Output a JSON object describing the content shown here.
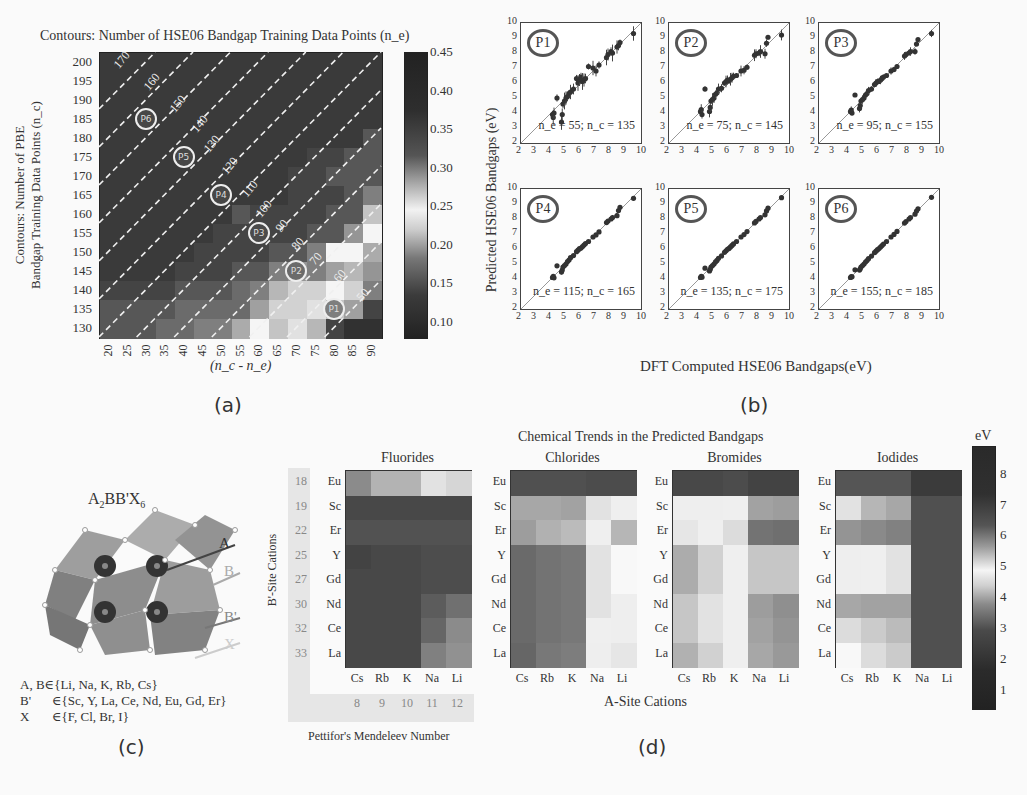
{
  "panels": {
    "a": {
      "label": "(a)"
    },
    "b": {
      "label": "(b)"
    },
    "c": {
      "label": "(c)"
    },
    "d": {
      "label": "(d)"
    }
  },
  "chart_data": [
    {
      "id": "a",
      "type": "heatmap",
      "title": "Contours: Number of HSE06 Bandgap Training Data Points (n_e)",
      "xlabel": "(n_c - n_e)",
      "ylabel": "Contours: Number of PBE Bandgap Training Data Points (n_c)",
      "ylabel_lines": [
        "Contours: Number of PBE",
        "Bandgap Training Data Points (n_c)"
      ],
      "x": [
        20,
        25,
        30,
        35,
        40,
        45,
        50,
        55,
        60,
        65,
        70,
        75,
        80,
        85,
        90
      ],
      "y": [
        200,
        195,
        190,
        185,
        180,
        175,
        170,
        165,
        160,
        155,
        150,
        145,
        140,
        135,
        130
      ],
      "colorbar": {
        "ticks": [
          "0.45",
          "0.40",
          "0.35",
          "0.30",
          "0.25",
          "0.20",
          "0.15",
          "0.10"
        ],
        "range": [
          0.08,
          0.45
        ]
      },
      "contours": [
        "170",
        "160",
        "150",
        "140",
        "130",
        "120",
        "110",
        "100",
        "90",
        "80",
        "70",
        "60",
        "50"
      ],
      "markers": [
        {
          "name": "P1",
          "x": 80,
          "y": 135
        },
        {
          "name": "P2",
          "x": 70,
          "y": 145
        },
        {
          "name": "P3",
          "x": 60,
          "y": 155
        },
        {
          "name": "P4",
          "x": 50,
          "y": 165
        },
        {
          "name": "P5",
          "x": 40,
          "y": 175
        },
        {
          "name": "P6",
          "x": 30,
          "y": 185
        }
      ],
      "values": [
        [
          0.43,
          0.43,
          0.43,
          0.43,
          0.43,
          0.43,
          0.43,
          0.43,
          0.43,
          0.43,
          0.43,
          0.43,
          0.43,
          0.43,
          0.43
        ],
        [
          0.43,
          0.43,
          0.43,
          0.43,
          0.43,
          0.43,
          0.43,
          0.43,
          0.43,
          0.43,
          0.43,
          0.43,
          0.43,
          0.43,
          0.43
        ],
        [
          0.43,
          0.43,
          0.43,
          0.43,
          0.43,
          0.43,
          0.43,
          0.43,
          0.43,
          0.43,
          0.43,
          0.43,
          0.43,
          0.43,
          0.43
        ],
        [
          0.43,
          0.43,
          0.43,
          0.43,
          0.43,
          0.43,
          0.43,
          0.43,
          0.43,
          0.43,
          0.43,
          0.43,
          0.43,
          0.43,
          0.43
        ],
        [
          0.43,
          0.43,
          0.43,
          0.43,
          0.43,
          0.43,
          0.43,
          0.43,
          0.43,
          0.43,
          0.43,
          0.43,
          0.43,
          0.43,
          0.4
        ],
        [
          0.43,
          0.43,
          0.43,
          0.43,
          0.43,
          0.43,
          0.43,
          0.43,
          0.43,
          0.43,
          0.43,
          0.42,
          0.42,
          0.4,
          0.4
        ],
        [
          0.43,
          0.43,
          0.43,
          0.43,
          0.43,
          0.43,
          0.43,
          0.43,
          0.43,
          0.43,
          0.42,
          0.42,
          0.4,
          0.4,
          0.4
        ],
        [
          0.43,
          0.43,
          0.43,
          0.43,
          0.43,
          0.43,
          0.43,
          0.43,
          0.43,
          0.43,
          0.42,
          0.42,
          0.42,
          0.4,
          0.36
        ],
        [
          0.43,
          0.43,
          0.43,
          0.43,
          0.43,
          0.43,
          0.43,
          0.4,
          0.42,
          0.42,
          0.42,
          0.42,
          0.4,
          0.4,
          0.3
        ],
        [
          0.43,
          0.43,
          0.43,
          0.43,
          0.43,
          0.43,
          0.42,
          0.42,
          0.42,
          0.42,
          0.42,
          0.4,
          0.4,
          0.34,
          0.27
        ],
        [
          0.43,
          0.43,
          0.43,
          0.43,
          0.43,
          0.42,
          0.42,
          0.42,
          0.42,
          0.4,
          0.4,
          0.36,
          0.27,
          0.27,
          0.32
        ],
        [
          0.43,
          0.43,
          0.43,
          0.43,
          0.42,
          0.42,
          0.42,
          0.4,
          0.4,
          0.36,
          0.34,
          0.36,
          0.33,
          0.31,
          0.34
        ],
        [
          0.42,
          0.42,
          0.42,
          0.42,
          0.4,
          0.4,
          0.4,
          0.38,
          0.36,
          0.31,
          0.29,
          0.29,
          0.27,
          0.29,
          0.36
        ],
        [
          0.4,
          0.4,
          0.4,
          0.4,
          0.38,
          0.38,
          0.38,
          0.38,
          0.33,
          0.29,
          0.29,
          0.28,
          0.3,
          0.33,
          0.12
        ],
        [
          0.4,
          0.4,
          0.4,
          0.38,
          0.38,
          0.36,
          0.36,
          0.32,
          0.27,
          0.3,
          0.26,
          0.31,
          0.12,
          0.1,
          0.1
        ]
      ]
    },
    {
      "id": "b",
      "type": "scatter",
      "xlabel": "DFT Computed HSE06 Bandgaps(eV)",
      "ylabel": "Predicted HSE06 Bandgaps (eV)",
      "xlim": [
        2,
        10
      ],
      "ylim": [
        2,
        10
      ],
      "ticks": [
        "2",
        "3",
        "4",
        "5",
        "6",
        "7",
        "8",
        "9",
        "10"
      ],
      "subplots": [
        {
          "tag": "P1",
          "annotation": "n_e = 55; n_c = 135",
          "ne": 55,
          "nc": 135
        },
        {
          "tag": "P2",
          "annotation": "n_e = 75; n_c = 145",
          "ne": 75,
          "nc": 145
        },
        {
          "tag": "P3",
          "annotation": "n_e = 95; n_c = 155",
          "ne": 95,
          "nc": 155
        },
        {
          "tag": "P4",
          "annotation": "n_e = 115; n_c = 165",
          "ne": 115,
          "nc": 165
        },
        {
          "tag": "P5",
          "annotation": "n_e = 135; n_c = 175",
          "ne": 135,
          "nc": 175
        },
        {
          "tag": "P6",
          "annotation": "n_e = 155; n_c = 185",
          "ne": 155,
          "nc": 185
        }
      ],
      "points": {
        "x": [
          4.1,
          4.15,
          4.2,
          4.4,
          4.7,
          4.75,
          4.8,
          4.9,
          5.0,
          5.1,
          5.2,
          5.3,
          5.5,
          5.7,
          5.8,
          5.9,
          6.0,
          6.1,
          6.2,
          6.3,
          6.5,
          6.8,
          7.0,
          7.2,
          7.7,
          7.8,
          8.0,
          8.1,
          8.4,
          8.5,
          8.6,
          9.5
        ],
        "P1_y": [
          3.9,
          3.7,
          4.0,
          5.0,
          3.4,
          3.9,
          4.6,
          4.8,
          5.0,
          5.1,
          5.3,
          5.4,
          5.6,
          6.3,
          6.0,
          6.2,
          6.4,
          6.1,
          6.2,
          6.3,
          7.1,
          7.0,
          6.8,
          7.2,
          7.7,
          7.9,
          8.1,
          8.0,
          8.4,
          8.5,
          8.7,
          9.3
        ],
        "P3_y": [
          4.1,
          4.2,
          4.0,
          5.2,
          4.3,
          4.5,
          4.8,
          4.9,
          5.0,
          5.2,
          5.3,
          5.5,
          5.6,
          5.9,
          6.0,
          6.1,
          6.1,
          6.2,
          6.3,
          6.4,
          6.5,
          6.8,
          6.9,
          7.1,
          7.8,
          7.9,
          8.0,
          8.1,
          8.1,
          8.6,
          8.9,
          9.3
        ]
      }
    },
    {
      "id": "d",
      "type": "heatmap",
      "title": "Chemical Trends in the Predicted Bandgaps",
      "xlabel": "A-Site Cations",
      "ylabel": "B'-Site Cations",
      "secondary_xlabel": "Pettifor's Mendeleev Number",
      "rows": [
        "Eu",
        "Sc",
        "Er",
        "Y",
        "Gd",
        "Nd",
        "Ce",
        "La"
      ],
      "row_mendeleev": [
        "18",
        "19",
        "22",
        "25",
        "27",
        "30",
        "32",
        "33"
      ],
      "cols": [
        "Cs",
        "Rb",
        "K",
        "Na",
        "Li"
      ],
      "col_mendeleev": [
        "8",
        "9",
        "10",
        "11",
        "12"
      ],
      "colorbar": {
        "label": "eV",
        "ticks": [
          "8",
          "7",
          "6",
          "5",
          "4",
          "3",
          "2",
          "1"
        ],
        "range": [
          0.4,
          8.9
        ]
      },
      "subplots": [
        {
          "name": "Fluorides",
          "values": [
            [
              6.6,
              5.9,
              5.9,
              4.6,
              4.4
            ],
            [
              7.9,
              7.9,
              7.9,
              7.9,
              7.9
            ],
            [
              7.7,
              7.7,
              7.7,
              7.7,
              7.7
            ],
            [
              8.0,
              7.9,
              7.9,
              7.8,
              7.8
            ],
            [
              7.9,
              7.9,
              7.9,
              7.8,
              7.8
            ],
            [
              7.9,
              7.9,
              7.9,
              7.5,
              7.1
            ],
            [
              7.9,
              7.9,
              7.9,
              7.3,
              6.6
            ],
            [
              7.9,
              7.9,
              7.9,
              6.8,
              6.5
            ]
          ]
        },
        {
          "name": "Chlorides",
          "values": [
            [
              1.6,
              1.6,
              1.6,
              1.5,
              1.5
            ],
            [
              3.5,
              3.5,
              3.4,
              4.6,
              4.8
            ],
            [
              3.3,
              3.7,
              3.9,
              4.8,
              3.8
            ],
            [
              2.2,
              2.4,
              2.5,
              4.6,
              4.9
            ],
            [
              2.2,
              2.4,
              2.5,
              4.6,
              4.9
            ],
            [
              2.2,
              2.4,
              2.5,
              4.6,
              5.0
            ],
            [
              2.2,
              2.4,
              2.5,
              4.8,
              5.0
            ],
            [
              2.1,
              2.5,
              2.6,
              5.0,
              5.1
            ]
          ]
        },
        {
          "name": "Bromides",
          "values": [
            [
              1.4,
              1.4,
              1.5,
              1.3,
              1.3
            ],
            [
              5.0,
              5.0,
              4.8,
              3.4,
              3.3
            ],
            [
              5.1,
              4.8,
              4.5,
              2.4,
              2.3
            ],
            [
              3.6,
              4.3,
              4.8,
              4.1,
              4.1
            ],
            [
              3.6,
              4.3,
              4.8,
              4.1,
              4.1
            ],
            [
              4.1,
              4.6,
              4.8,
              3.3,
              3.0
            ],
            [
              4.1,
              4.6,
              4.8,
              3.4,
              3.1
            ],
            [
              3.7,
              4.3,
              4.8,
              3.5,
              3.2
            ]
          ]
        },
        {
          "name": "Iodides",
          "values": [
            [
              1.7,
              1.7,
              1.7,
              1.1,
              1.1
            ],
            [
              4.6,
              3.8,
              3.5,
              1.6,
              1.6
            ],
            [
              3.1,
              2.9,
              2.7,
              1.6,
              1.6
            ],
            [
              5.0,
              4.8,
              4.6,
              1.6,
              1.6
            ],
            [
              5.0,
              4.8,
              4.6,
              1.6,
              1.6
            ],
            [
              3.5,
              3.4,
              3.4,
              1.6,
              1.6
            ],
            [
              4.5,
              4.2,
              3.9,
              1.6,
              1.6
            ],
            [
              4.9,
              4.5,
              4.2,
              1.6,
              1.6
            ]
          ]
        }
      ]
    }
  ],
  "structure": {
    "title": "A2BB'X6",
    "arrows": [
      "A",
      "B",
      "B'",
      "X"
    ],
    "legend": [
      {
        "site": "A, B",
        "set": "∈{Li, Na, K, Rb, Cs}"
      },
      {
        "site": "B'",
        "set": "∈{Sc, Y, La, Ce, Nd, Eu, Gd, Er}"
      },
      {
        "site": "X",
        "set": "∈{F, Cl, Br, I}"
      }
    ]
  }
}
